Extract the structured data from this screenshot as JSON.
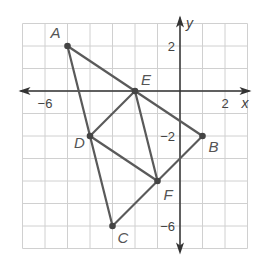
{
  "diagram": {
    "type": "coordinate-plane-figure",
    "grid": {
      "x_min": -7,
      "x_max": 3,
      "y_min": -7,
      "y_max": 3,
      "unit_px": 22.5,
      "origin_px": [
        180,
        91
      ],
      "grid_color": "#d0d0d0"
    },
    "axes": {
      "x_label": "x",
      "y_label": "y",
      "x_ticks": [
        {
          "value": -6,
          "label": "−6"
        },
        {
          "value": 2,
          "label": "2"
        }
      ],
      "y_ticks": [
        {
          "value": 2,
          "label": "2"
        },
        {
          "value": -2,
          "label": "−2"
        },
        {
          "value": -6,
          "label": "−6"
        }
      ],
      "axis_color": "#333333"
    },
    "points": [
      {
        "name": "A",
        "x": -5,
        "y": 2
      },
      {
        "name": "B",
        "x": 1,
        "y": -2
      },
      {
        "name": "C",
        "x": -3,
        "y": -6
      },
      {
        "name": "D",
        "x": -4,
        "y": -2
      },
      {
        "name": "E",
        "x": -2,
        "y": 0
      },
      {
        "name": "F",
        "x": -1,
        "y": -4
      }
    ],
    "segments": [
      [
        "A",
        "B"
      ],
      [
        "B",
        "C"
      ],
      [
        "C",
        "A"
      ],
      [
        "D",
        "E"
      ],
      [
        "E",
        "F"
      ],
      [
        "F",
        "D"
      ]
    ],
    "line_color": "#5a5a5a",
    "point_color": "#444444"
  }
}
